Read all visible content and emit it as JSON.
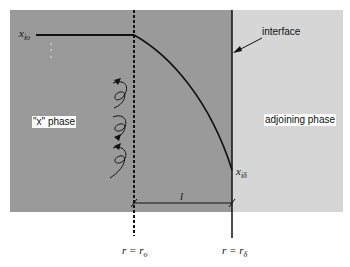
{
  "diagram": {
    "type": "concentration-profile",
    "regions": {
      "left_phase_label": "\"x\" phase",
      "right_phase_label": "adjoining phase"
    },
    "annotations": {
      "interface_label": "interface",
      "boundary_thickness_label": "l"
    },
    "concentration_labels": {
      "bulk": {
        "base": "x",
        "sub": "io"
      },
      "interface": {
        "base": "x",
        "sub": "iδ"
      }
    },
    "position_labels": {
      "r0": {
        "lhs": "r = r",
        "sub": "o"
      },
      "rdelta": {
        "lhs": "r = r",
        "sub": "δ"
      }
    },
    "colors": {
      "x_phase_fill": "#9a9a9a",
      "adjoining_phase_fill": "#d6d6d6",
      "line": "#111111"
    }
  }
}
